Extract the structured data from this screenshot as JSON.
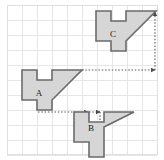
{
  "figure": {
    "name": "translation-grid-figure",
    "width": 164,
    "height": 160,
    "background": "#ffffff",
    "frame_color": "#e2e2e2",
    "grid": {
      "cell_size": 15,
      "color": "#e6e6e6",
      "minor_color": "#f0eeec",
      "origin_x": 7,
      "origin_y": 5,
      "cols": 10,
      "rows": 10
    },
    "shape_style": {
      "fill": "#d6d6d6",
      "stroke": "#6b6b6b",
      "stroke_width": 1.6
    },
    "arrow_style": {
      "color": "#5a5a5a",
      "dash": "1.5,1.8",
      "width": 1.1
    }
  },
  "shapes": [
    {
      "label": "A",
      "name": "shape-a",
      "label_x": 39,
      "label_y": 94,
      "points": "22,70 22,100 37,100 37,110 52,110 52,100 82,70 52,70 52,80 37,80 37,70"
    },
    {
      "label": "B",
      "name": "shape-b",
      "label_x": 91,
      "label_y": 129,
      "points": "74,112 74,142 89,142 89,157 104,157 104,127 134,112 104,112 104,122 89,122 89,112"
    },
    {
      "label": "C",
      "name": "shape-c",
      "label_x": 113,
      "label_y": 35,
      "points": "96,11 96,41 111,41 111,51 126,51 126,41 156,11 126,11 126,21 111,21 111,11"
    }
  ],
  "arrows": [
    {
      "name": "translation-arrow-a-to-right",
      "type": "dotted",
      "x1": 82,
      "y1": 70,
      "x2": 155,
      "y2": 70
    },
    {
      "name": "translation-arrow-up-to-c",
      "type": "dotted",
      "x1": 155,
      "y1": 70,
      "x2": 155,
      "y2": 12
    },
    {
      "name": "translation-arrow-a-to-b",
      "type": "dotted",
      "x1": 38,
      "y1": 112,
      "x2": 88,
      "y2": 112
    },
    {
      "name": "translation-arrow-b-inner-right",
      "type": "dotted",
      "x1": 89,
      "y1": 112,
      "x2": 100,
      "y2": 112
    },
    {
      "name": "translation-arrow-b-inner-down",
      "type": "dotted",
      "x1": 100,
      "y1": 112,
      "x2": 100,
      "y2": 150
    }
  ]
}
